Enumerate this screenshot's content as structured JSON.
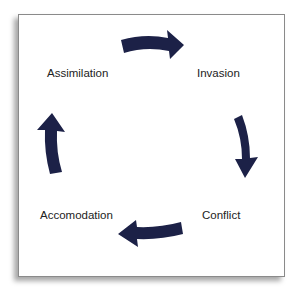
{
  "diagram": {
    "type": "cycle",
    "arrow_color": "#1c2147",
    "nodes": [
      {
        "id": "invasion",
        "label": "Invasion"
      },
      {
        "id": "conflict",
        "label": "Conflict"
      },
      {
        "id": "accomodation",
        "label": "Accomodation"
      },
      {
        "id": "assimilation",
        "label": "Assimilation"
      }
    ],
    "edges": [
      {
        "from": "assimilation",
        "to": "invasion",
        "icon": "curved-arrow-right-icon"
      },
      {
        "from": "invasion",
        "to": "conflict",
        "icon": "curved-arrow-down-icon"
      },
      {
        "from": "conflict",
        "to": "accomodation",
        "icon": "curved-arrow-left-icon"
      },
      {
        "from": "accomodation",
        "to": "assimilation",
        "icon": "curved-arrow-up-icon"
      }
    ]
  }
}
